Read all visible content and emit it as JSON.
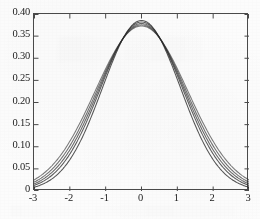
{
  "figure": {
    "background_color": "#fcfcfc",
    "axis_color": "#4a4a4a",
    "curve_color": "#2a2a2a"
  },
  "chart_data": {
    "type": "line",
    "title": "",
    "subtitle": "",
    "xlabel": "",
    "ylabel": "",
    "xlim": [
      -3,
      3
    ],
    "ylim": [
      0,
      0.4
    ],
    "grid": false,
    "legend": "none",
    "xticks": [
      -3,
      -2,
      -1,
      0,
      1,
      2,
      3
    ],
    "xtick_labels": [
      "-3",
      "-2",
      "-1",
      "0",
      "1",
      "2",
      "3"
    ],
    "yticks": [
      0,
      0.05,
      0.1,
      0.15,
      0.2,
      0.25,
      0.3,
      0.35,
      0.4
    ],
    "ytick_labels": [
      "0",
      "0.05",
      "0.10",
      "0.15",
      "0.20",
      "0.25",
      "0.30",
      "0.35",
      "0.40"
    ],
    "x": [
      -3.0,
      -2.75,
      -2.5,
      -2.25,
      -2.0,
      -1.75,
      -1.5,
      -1.25,
      -1.0,
      -0.75,
      -0.5,
      -0.25,
      0.0,
      0.25,
      0.5,
      0.75,
      1.0,
      1.25,
      1.5,
      1.75,
      2.0,
      2.25,
      2.5,
      2.75,
      3.0
    ],
    "series": [
      {
        "name": "curve-1",
        "peak": 0.3855,
        "tail_at_3": 0.0085,
        "values": [
          0.0085,
          0.0148,
          0.0245,
          0.0385,
          0.0574,
          0.0812,
          0.1092,
          0.1396,
          0.17,
          0.1975,
          0.2196,
          0.2342,
          0.2394,
          0.2342,
          0.2196,
          0.1975,
          0.17,
          0.1396,
          0.1092,
          0.0812,
          0.0574,
          0.0385,
          0.0245,
          0.0148,
          0.0085
        ]
      },
      {
        "name": "curve-2",
        "peak": 0.382,
        "tail_at_3": 0.0125,
        "values": [
          0.0125,
          0.02,
          0.031,
          0.0456,
          0.0645,
          0.0874,
          0.1133,
          0.1405,
          0.167,
          0.1901,
          0.208,
          0.2191,
          0.2229,
          0.2191,
          0.208,
          0.1901,
          0.167,
          0.1405,
          0.1133,
          0.0874,
          0.0645,
          0.0456,
          0.031,
          0.02,
          0.0125
        ]
      },
      {
        "name": "curve-3",
        "peak": 0.3785,
        "tail_at_3": 0.016,
        "values": [
          0.016,
          0.0243,
          0.036,
          0.051,
          0.0698,
          0.0918,
          0.116,
          0.1408,
          0.1644,
          0.1847,
          0.2,
          0.2093,
          0.2125,
          0.2093,
          0.2,
          0.1847,
          0.1644,
          0.1408,
          0.116,
          0.0918,
          0.0698,
          0.051,
          0.036,
          0.0243,
          0.016
        ]
      },
      {
        "name": "curve-4",
        "peak": 0.3755,
        "tail_at_3": 0.02,
        "values": [
          0.02,
          0.0292,
          0.0415,
          0.0567,
          0.0751,
          0.096,
          0.1186,
          0.1414,
          0.1628,
          0.181,
          0.1945,
          0.2026,
          0.2054,
          0.2026,
          0.1945,
          0.181,
          0.1628,
          0.1414,
          0.1186,
          0.096,
          0.0751,
          0.0567,
          0.0415,
          0.0292,
          0.02
        ]
      },
      {
        "name": "curve-5",
        "peak": 0.373,
        "tail_at_3": 0.025,
        "values": [
          0.025,
          0.035,
          0.0478,
          0.0632,
          0.0812,
          0.101,
          0.122,
          0.1428,
          0.162,
          0.1782,
          0.1902,
          0.1973,
          0.1997,
          0.1973,
          0.1902,
          0.1782,
          0.162,
          0.1428,
          0.122,
          0.101,
          0.0812,
          0.0632,
          0.0478,
          0.035,
          0.025
        ]
      }
    ]
  }
}
